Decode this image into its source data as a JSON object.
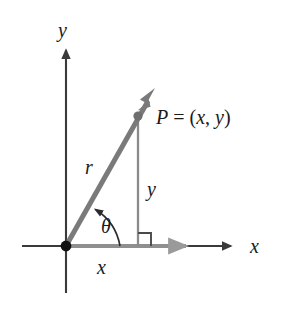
{
  "figure": {
    "kind": "polar-coordinates-right-triangle-diagram",
    "background_color": "#ffffff"
  },
  "colors": {
    "axis": "#3a3a3a",
    "vector": "#7a7a7a",
    "leg_vertical": "#8a8a8a",
    "leg_horizontal": "#8f8f8f",
    "label": "#1a1a1a",
    "origin_dot": "#111111",
    "point_dot": "#6f6f6f",
    "right_angle": "#4a4a4a",
    "theta_arc": "#2b2b2b"
  },
  "axes": {
    "x_axis": {
      "label": "x",
      "label_x": 252,
      "label_y": 253,
      "line": {
        "x1": 22,
        "y1": 246,
        "x2": 232,
        "y2": 246
      },
      "arrow_tip_x": 236
    },
    "y_axis": {
      "label": "y",
      "label_x": 58,
      "label_y": 37,
      "line": {
        "x1": 66,
        "y1": 292,
        "x2": 66,
        "y2": 48
      },
      "arrow_tip_y": 43
    }
  },
  "origin": {
    "name": "origin",
    "cx": 66,
    "cy": 246,
    "r": 5.2
  },
  "point_p": {
    "label": "P = (x, y)",
    "label_parts": {
      "p": "P",
      "equals": " = ",
      "open_paren": "(",
      "x": "x",
      "comma": ", ",
      "y": "y",
      "close_paren": ")"
    },
    "cx": 138,
    "cy": 116,
    "dot_r": 4.4,
    "label_x": 156,
    "label_y": 124
  },
  "vector_r": {
    "label": "r",
    "label_x": 86,
    "label_y": 172,
    "line": {
      "x1": 66,
      "y1": 246,
      "x2": 149,
      "y2": 100
    },
    "arrow_tip": {
      "x": 153,
      "y": 93
    },
    "width": 5
  },
  "leg_y": {
    "label": "y",
    "label_x": 147,
    "label_y": 195,
    "line": {
      "x1": 138,
      "y1": 116,
      "x2": 138,
      "y2": 246
    },
    "width": 2.2
  },
  "leg_x": {
    "label": "x",
    "label_x": 98,
    "label_y": 273,
    "line": {
      "x1": 66,
      "y1": 246,
      "x2": 183,
      "y2": 246
    },
    "arrow_tip_x": 192,
    "width": 4
  },
  "angle_theta": {
    "label": "θ",
    "label_x": 105,
    "label_y": 232,
    "arc_start": {
      "x": 118,
      "y": 246
    },
    "arc_end": {
      "x": 94,
      "y": 212
    },
    "arc_radius": 52,
    "arrow_at": "end"
  },
  "right_angle_marker": {
    "name": "right-angle-square",
    "x": 138,
    "y": 246,
    "size": 13,
    "direction": "up-right"
  }
}
